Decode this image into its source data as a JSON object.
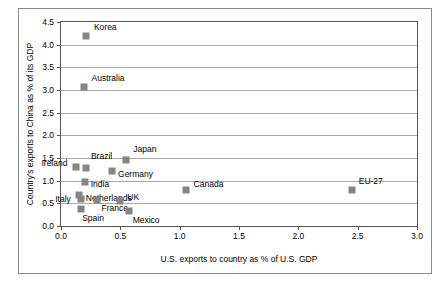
{
  "chart_data": {
    "type": "scatter",
    "title": "",
    "xlabel": "U.S. exports to country as % of U.S. GDP",
    "ylabel": "Country's exports to China as % of its GDP",
    "xlim": [
      0.0,
      3.0
    ],
    "ylim": [
      0.0,
      4.5
    ],
    "xticks": [
      "0.0",
      "0.5",
      "1.0",
      "1.5",
      "2.0",
      "2.5",
      "3.0"
    ],
    "xtick_values": [
      0.0,
      0.5,
      1.0,
      1.5,
      2.0,
      2.5,
      3.0
    ],
    "yticks": [
      "0.0",
      "0.5",
      "1.0",
      "1.5",
      "2.0",
      "2.5",
      "3.0",
      "3.5",
      "4.0",
      "4.5"
    ],
    "ytick_values": [
      0.0,
      0.5,
      1.0,
      1.5,
      2.0,
      2.5,
      3.0,
      3.5,
      4.0,
      4.5
    ],
    "grid": "horizontal",
    "legend": "none",
    "marker_color": "#858585",
    "points": [
      {
        "label": "Korea",
        "x": 0.21,
        "y": 4.2,
        "label_dx": 8,
        "label_dy": -9
      },
      {
        "label": "Australia",
        "x": 0.19,
        "y": 3.07,
        "label_dx": 8,
        "label_dy": -9
      },
      {
        "label": "Japan",
        "x": 0.55,
        "y": 1.45,
        "label_dx": 7,
        "label_dy": -11
      },
      {
        "label": "Brazil",
        "x": 0.21,
        "y": 1.28,
        "label_dx": 5,
        "label_dy": -12
      },
      {
        "label": "Ireland",
        "x": 0.13,
        "y": 1.3,
        "label_dx": -35,
        "label_dy": -4
      },
      {
        "label": "Germany",
        "x": 0.43,
        "y": 1.22,
        "label_dx": 6,
        "label_dy": 3
      },
      {
        "label": "India",
        "x": 0.2,
        "y": 0.97,
        "label_dx": 6,
        "label_dy": 2
      },
      {
        "label": "Canada",
        "x": 1.05,
        "y": 0.8,
        "label_dx": 8,
        "label_dy": -6
      },
      {
        "label": "EU-27",
        "x": 2.45,
        "y": 0.8,
        "label_dx": 7,
        "label_dy": -9
      },
      {
        "label": "Netherlands",
        "x": 0.15,
        "y": 0.68,
        "label_dx": 7,
        "label_dy": 3
      },
      {
        "label": "Italy",
        "x": 0.17,
        "y": 0.6,
        "label_dx": -26,
        "label_dy": 0
      },
      {
        "label": "France",
        "x": 0.3,
        "y": 0.58,
        "label_dx": 5,
        "label_dy": 8
      },
      {
        "label": "UK",
        "x": 0.5,
        "y": 0.55,
        "label_dx": 7,
        "label_dy": -4
      },
      {
        "label": "Spain",
        "x": 0.17,
        "y": 0.38,
        "label_dx": 1,
        "label_dy": 9
      },
      {
        "label": "Mexico",
        "x": 0.57,
        "y": 0.32,
        "label_dx": 4,
        "label_dy": 9
      }
    ]
  }
}
